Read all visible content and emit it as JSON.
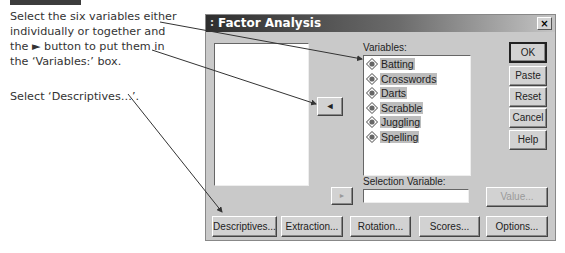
{
  "instructions": {
    "step1": [
      "Select the six variables either",
      "individually or together and",
      "the ► button to put them in",
      "the ‘Variables:’ box."
    ],
    "step2": "Select ‘Descriptives…’."
  },
  "dialog": {
    "title": "Factor Analysis",
    "grip": ":",
    "close_label": "×",
    "variables_label": "Variables:",
    "variables": [
      {
        "name": "Batting",
        "icon": "numeric-variable-icon"
      },
      {
        "name": "Crosswords",
        "icon": "numeric-variable-icon"
      },
      {
        "name": "Darts",
        "icon": "numeric-variable-icon"
      },
      {
        "name": "Scrabble",
        "icon": "numeric-variable-icon"
      },
      {
        "name": "Juggling",
        "icon": "numeric-variable-icon"
      },
      {
        "name": "Spelling",
        "icon": "numeric-variable-icon"
      }
    ],
    "move_button_glyph": "◄",
    "selection_move_glyph": "►",
    "selection_variable_label": "Selection Variable:",
    "selection_variable_value": "",
    "side_buttons": {
      "ok": "OK",
      "paste": "Paste",
      "reset": "Reset",
      "cancel": "Cancel",
      "help": "Help"
    },
    "value_button": "Value...",
    "bottom_buttons": {
      "descriptives": "Descriptives...",
      "extraction": "Extraction...",
      "rotation": "Rotation...",
      "scores": "Scores...",
      "options": "Options..."
    }
  }
}
